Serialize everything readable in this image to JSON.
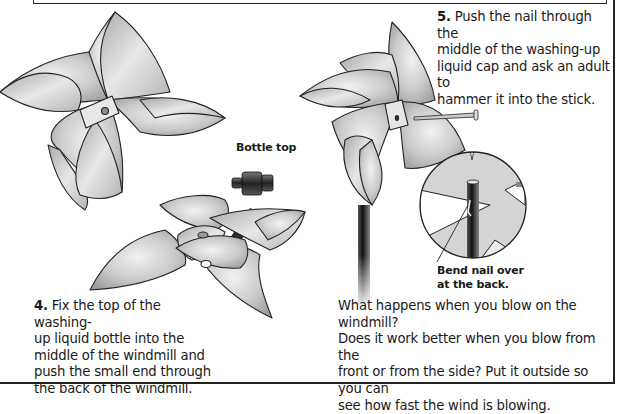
{
  "page": {
    "kind": "instructional illustration page"
  },
  "steps": [
    {
      "number": "4.",
      "text": "Fix the top of the washing-up liquid bottle into the middle of the windmill and push the small end through the back of the windmill.",
      "lines": [
        "Fix the top of the washing-",
        "up liquid bottle into the",
        "middle of the windmill and",
        "push the small end through",
        "the back of the windmill."
      ]
    },
    {
      "number": "5.",
      "text": "Push the nail through the middle of the washing-up liquid cap and ask an adult to hammer it into the stick.",
      "lines": [
        "Push the nail through the",
        "middle of the washing-up",
        "liquid cap and ask an adult to",
        "hammer it into the stick."
      ]
    }
  ],
  "labels": {
    "bottle_top": "Bottle top",
    "bend_nail_line1": "Bend nail over",
    "bend_nail_line2": "at the back."
  },
  "question": {
    "lines": [
      "What happens when you blow on the windmill?",
      "Does it work better when you blow from the",
      "front or from the side? Put it outside so you can",
      "see how fast the wind is blowing."
    ]
  },
  "illustrations": [
    {
      "name": "paper-windmill-front",
      "description": "Four-bladed paper windmill with pin hole in centre"
    },
    {
      "name": "bottle-top",
      "description": "Dark plastic washing-up liquid bottle cap"
    },
    {
      "name": "arrow",
      "description": "Dark arrow pointing from bottle top into windmill centre"
    },
    {
      "name": "windmill-assembly",
      "description": "Windmill laid flat with cap hole"
    },
    {
      "name": "windmill-on-stick",
      "description": "Finished windmill mounted on stick with nail"
    },
    {
      "name": "nail",
      "description": "Nail pushed through the windmill centre"
    },
    {
      "name": "detail-circle",
      "description": "Magnified view of stick with nail bent over at the back"
    }
  ],
  "colors": {
    "line": "#222222",
    "paper_light": "#e6e6e6",
    "paper_mid": "#bdbdbd",
    "paper_dark": "#9a9a9a",
    "cap": "#333333"
  }
}
